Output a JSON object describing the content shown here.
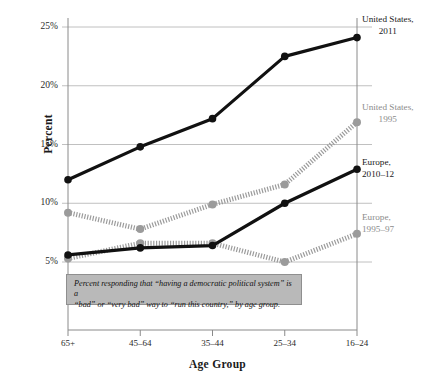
{
  "chart_data": {
    "type": "line",
    "title": "",
    "xlabel": "Age Group",
    "ylabel": "Percent",
    "categories": [
      "65+",
      "45–64",
      "35–44",
      "25–34",
      "16–24"
    ],
    "ylim": [
      0,
      25
    ],
    "yticks": [
      5,
      10,
      15,
      20,
      25
    ],
    "ytick_labels": [
      "5%",
      "10%",
      "15%",
      "20%",
      "25%"
    ],
    "grid": true,
    "legend_position": "right-inline-labels",
    "series": [
      {
        "name": "United States, 2011",
        "label_line1": "United States,",
        "label_line2": "2011",
        "color": "#111111",
        "style": "solid",
        "values": [
          12.0,
          14.8,
          17.2,
          22.5,
          24.1
        ]
      },
      {
        "name": "United States, 1995",
        "label_line1": "United States,",
        "label_line2": "1995",
        "color": "#9b9b9b",
        "style": "dotted",
        "values": [
          9.2,
          7.8,
          9.9,
          11.6,
          16.9
        ]
      },
      {
        "name": "Europe, 2010–12",
        "label_line1": "Europe,",
        "label_line2": "2010–12",
        "color": "#111111",
        "style": "solid",
        "values": [
          5.6,
          6.2,
          6.4,
          10.0,
          12.9
        ]
      },
      {
        "name": "Europe, 1995–97",
        "label_line1": "Europe,",
        "label_line2": "1995–97",
        "color": "#9b9b9b",
        "style": "dotted",
        "values": [
          5.3,
          6.6,
          6.6,
          5.0,
          7.4
        ]
      }
    ],
    "annotation": {
      "line1": "Percent responding that “having a democratic political system” is a",
      "line2": "“bad” or “very bad” way to “run this country,” by age group."
    }
  },
  "colors": {
    "dark_series": "#111111",
    "light_series": "#9b9b9b",
    "grid": "#b0b0b0",
    "axis": "#8a8a8a",
    "annotation_bg": "#b9b9b9",
    "annotation_border": "#8f8f8f"
  }
}
